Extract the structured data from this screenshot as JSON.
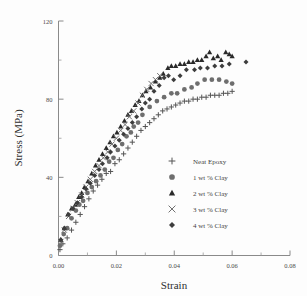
{
  "chart_data": {
    "type": "scatter",
    "title": "",
    "xlabel": "Strain",
    "ylabel": "Stress (MPa)",
    "xlim": [
      0,
      0.08
    ],
    "ylim": [
      0,
      120
    ],
    "xticks": [
      0.0,
      0.02,
      0.04,
      0.06,
      0.08
    ],
    "xticklabels": [
      "0.00",
      "0.02",
      "0.04",
      "0.06",
      "0.08"
    ],
    "xminorticks": [
      0.01,
      0.03,
      0.05,
      0.07
    ],
    "yticks": [
      0,
      40,
      80,
      120
    ],
    "yticklabels": [
      "0",
      "40",
      "80",
      "120"
    ],
    "yminorticks": [
      20,
      60,
      100
    ],
    "grid": false,
    "legend_position": "center-right-inside",
    "series": [
      {
        "name": "Neat Epoxy",
        "marker": "plus",
        "color": "#555555",
        "points": [
          [
            0.0005,
            3
          ],
          [
            0.0015,
            6
          ],
          [
            0.003,
            9
          ],
          [
            0.0045,
            13
          ],
          [
            0.006,
            17
          ],
          [
            0.0075,
            21
          ],
          [
            0.009,
            25
          ],
          [
            0.0105,
            29
          ],
          [
            0.012,
            33
          ],
          [
            0.0135,
            36
          ],
          [
            0.015,
            39
          ],
          [
            0.0165,
            42
          ],
          [
            0.018,
            43
          ],
          [
            0.0195,
            47
          ],
          [
            0.021,
            49
          ],
          [
            0.0225,
            52
          ],
          [
            0.024,
            55
          ],
          [
            0.0255,
            58
          ],
          [
            0.027,
            61
          ],
          [
            0.0285,
            64
          ],
          [
            0.03,
            66
          ],
          [
            0.0315,
            68
          ],
          [
            0.033,
            70
          ],
          [
            0.0345,
            72
          ],
          [
            0.036,
            74
          ],
          [
            0.0375,
            75
          ],
          [
            0.039,
            76
          ],
          [
            0.0405,
            77
          ],
          [
            0.042,
            78
          ],
          [
            0.0435,
            79
          ],
          [
            0.045,
            79
          ],
          [
            0.0465,
            80
          ],
          [
            0.048,
            80
          ],
          [
            0.0495,
            81
          ],
          [
            0.051,
            81
          ],
          [
            0.0525,
            82
          ],
          [
            0.054,
            82
          ],
          [
            0.0555,
            82
          ],
          [
            0.057,
            83
          ],
          [
            0.0585,
            83
          ],
          [
            0.06,
            84
          ]
        ]
      },
      {
        "name": "1 wt % Clay",
        "marker": "circle",
        "color": "#6e6e6e",
        "points": [
          [
            0.0005,
            5
          ],
          [
            0.0018,
            11
          ],
          [
            0.003,
            14
          ],
          [
            0.0045,
            19
          ],
          [
            0.006,
            23
          ],
          [
            0.0072,
            26
          ],
          [
            0.0085,
            28
          ],
          [
            0.01,
            32
          ],
          [
            0.0115,
            35
          ],
          [
            0.013,
            38
          ],
          [
            0.0145,
            41
          ],
          [
            0.016,
            44
          ],
          [
            0.0175,
            48
          ],
          [
            0.019,
            50
          ],
          [
            0.0205,
            54
          ],
          [
            0.022,
            57
          ],
          [
            0.0235,
            61
          ],
          [
            0.025,
            63
          ],
          [
            0.026,
            66
          ],
          [
            0.0275,
            68
          ],
          [
            0.029,
            72
          ],
          [
            0.0315,
            76
          ],
          [
            0.034,
            79
          ],
          [
            0.0365,
            81
          ],
          [
            0.039,
            83
          ],
          [
            0.041,
            83
          ],
          [
            0.0435,
            85
          ],
          [
            0.046,
            86
          ],
          [
            0.048,
            88
          ],
          [
            0.0505,
            90
          ],
          [
            0.053,
            90
          ],
          [
            0.0555,
            90
          ],
          [
            0.058,
            89
          ],
          [
            0.06,
            88
          ]
        ]
      },
      {
        "name": "2 wt % Clay",
        "marker": "triangle",
        "color": "#2a2a2a",
        "points": [
          [
            0.0008,
            8
          ],
          [
            0.002,
            14
          ],
          [
            0.0032,
            21
          ],
          [
            0.0045,
            24
          ],
          [
            0.0058,
            26
          ],
          [
            0.007,
            30
          ],
          [
            0.008,
            32
          ],
          [
            0.009,
            35
          ],
          [
            0.0102,
            38
          ],
          [
            0.0115,
            42
          ],
          [
            0.0128,
            46
          ],
          [
            0.014,
            49
          ],
          [
            0.0152,
            52
          ],
          [
            0.0165,
            55
          ],
          [
            0.0178,
            58
          ],
          [
            0.019,
            61
          ],
          [
            0.0202,
            63
          ],
          [
            0.0215,
            66
          ],
          [
            0.0228,
            69
          ],
          [
            0.024,
            72
          ],
          [
            0.0252,
            74
          ],
          [
            0.0265,
            77
          ],
          [
            0.0278,
            79
          ],
          [
            0.029,
            82
          ],
          [
            0.0302,
            84
          ],
          [
            0.0318,
            86
          ],
          [
            0.0335,
            89
          ],
          [
            0.035,
            91
          ],
          [
            0.0362,
            93
          ],
          [
            0.0378,
            96
          ],
          [
            0.039,
            97
          ],
          [
            0.0405,
            97
          ],
          [
            0.042,
            98
          ],
          [
            0.0435,
            98
          ],
          [
            0.045,
            99
          ],
          [
            0.0465,
            99
          ],
          [
            0.048,
            100
          ],
          [
            0.0495,
            100
          ],
          [
            0.051,
            102
          ],
          [
            0.0522,
            104
          ],
          [
            0.0535,
            101
          ],
          [
            0.055,
            102
          ],
          [
            0.0562,
            100
          ],
          [
            0.0578,
            104
          ],
          [
            0.059,
            103
          ],
          [
            0.06,
            102
          ]
        ]
      },
      {
        "name": "3 wt % Clay",
        "marker": "cross",
        "color": "#707070",
        "points": [
          [
            0.0008,
            7
          ],
          [
            0.002,
            13
          ],
          [
            0.0035,
            20
          ],
          [
            0.005,
            24
          ],
          [
            0.0065,
            27
          ],
          [
            0.008,
            31
          ],
          [
            0.0095,
            35
          ],
          [
            0.011,
            39
          ],
          [
            0.0125,
            43
          ],
          [
            0.014,
            46
          ],
          [
            0.0155,
            50
          ],
          [
            0.017,
            53
          ],
          [
            0.0185,
            57
          ],
          [
            0.02,
            60
          ],
          [
            0.0215,
            64
          ],
          [
            0.023,
            67
          ],
          [
            0.0245,
            71
          ],
          [
            0.026,
            74
          ],
          [
            0.0275,
            78
          ],
          [
            0.029,
            82
          ],
          [
            0.0305,
            85
          ],
          [
            0.032,
            88
          ],
          [
            0.0335,
            90
          ],
          [
            0.035,
            92
          ]
        ]
      },
      {
        "name": "4 wt % Clay",
        "marker": "diamond",
        "color": "#3d3d3d",
        "points": [
          [
            0.0008,
            8
          ],
          [
            0.002,
            14
          ],
          [
            0.0035,
            21
          ],
          [
            0.005,
            24
          ],
          [
            0.0065,
            27
          ],
          [
            0.008,
            30
          ],
          [
            0.0095,
            34
          ],
          [
            0.011,
            37
          ],
          [
            0.0125,
            41
          ],
          [
            0.014,
            44
          ],
          [
            0.0152,
            47
          ],
          [
            0.0168,
            50
          ],
          [
            0.018,
            53
          ],
          [
            0.0195,
            56
          ],
          [
            0.021,
            59
          ],
          [
            0.0225,
            62
          ],
          [
            0.024,
            65
          ],
          [
            0.0255,
            68
          ],
          [
            0.027,
            71
          ],
          [
            0.0288,
            75
          ],
          [
            0.03,
            78
          ],
          [
            0.0315,
            80
          ],
          [
            0.033,
            84
          ],
          [
            0.0348,
            87
          ],
          [
            0.0365,
            91
          ],
          [
            0.038,
            92
          ],
          [
            0.0398,
            90
          ],
          [
            0.042,
            92
          ],
          [
            0.0442,
            95
          ],
          [
            0.047,
            95
          ],
          [
            0.049,
            96
          ],
          [
            0.0515,
            96
          ],
          [
            0.054,
            97
          ],
          [
            0.0565,
            97
          ],
          [
            0.059,
            98
          ],
          [
            0.0648,
            99
          ]
        ]
      }
    ]
  },
  "legend": {
    "entries": [
      {
        "label": "Neat Epoxy",
        "marker": "plus"
      },
      {
        "label": "1 wt  % Clay",
        "marker": "circle"
      },
      {
        "label": "2 wt  % Clay",
        "marker": "triangle"
      },
      {
        "label": "3 wt  % Clay",
        "marker": "cross"
      },
      {
        "label": "4 wt  % Clay",
        "marker": "diamond"
      }
    ]
  }
}
